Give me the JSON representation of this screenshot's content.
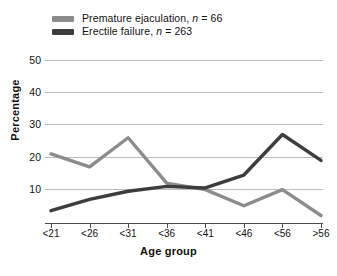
{
  "legend": {
    "position": "top-left",
    "entries": [
      {
        "label": "Premature ejaculation, n = 66",
        "name": "Premature ejaculation",
        "n": 66,
        "color": "#8c8c8c"
      },
      {
        "label": "Erectile failure, n = 263",
        "name": "Erectile failure",
        "n": 263,
        "color": "#3d3d3d"
      }
    ]
  },
  "axes": {
    "xlabel": "Age group",
    "ylabel": "Percentage",
    "yticks": [
      "50",
      "40",
      "30",
      "20",
      "10"
    ],
    "xticks": [
      "<21",
      "<26",
      "<31",
      "<36",
      "<41",
      "<46",
      "<56",
      ">56"
    ]
  },
  "chart_data": {
    "type": "line",
    "title": "",
    "xlabel": "Age group",
    "ylabel": "Percentage",
    "categories": [
      "<21",
      "<26",
      "<31",
      "<36",
      "<41",
      "<46",
      "<56",
      ">56"
    ],
    "series": [
      {
        "name": "Premature ejaculation",
        "n": 66,
        "color": "#8c8c8c",
        "values": [
          21,
          17,
          26,
          12,
          10,
          5,
          10,
          2
        ]
      },
      {
        "name": "Erectile failure",
        "n": 263,
        "color": "#3d3d3d",
        "values": [
          3.5,
          7,
          9.5,
          11,
          10.5,
          14.5,
          27,
          19
        ]
      }
    ],
    "ylim": [
      0,
      50
    ],
    "ytick_values": [
      10,
      20,
      30,
      40,
      50
    ],
    "grid": "horizontal",
    "legend_position": "top-left"
  }
}
